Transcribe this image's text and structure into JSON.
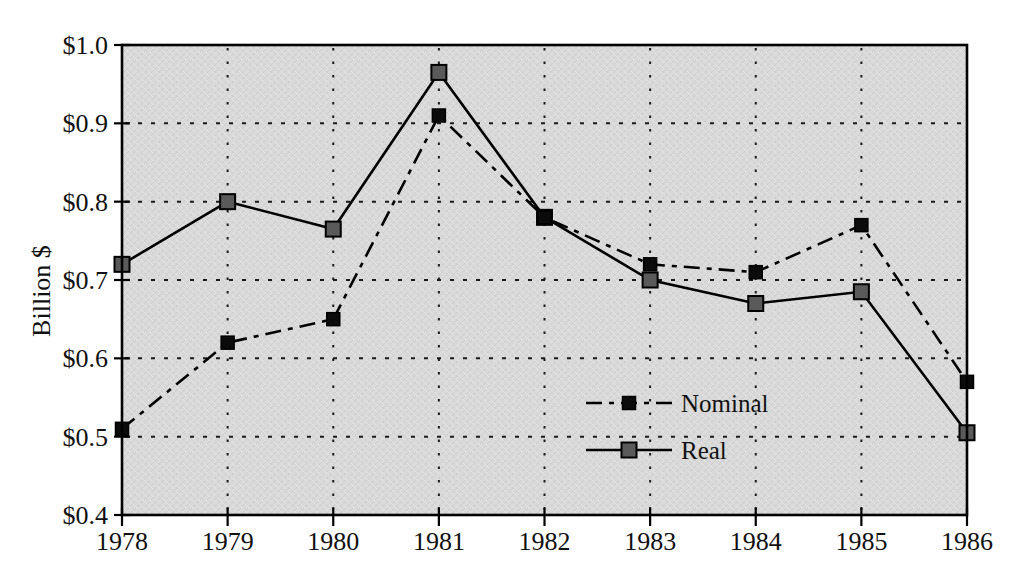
{
  "figure": {
    "background": "#ffffff",
    "text_color": "#111111"
  },
  "chart_data": {
    "type": "line",
    "title": "",
    "xlabel": "",
    "ylabel": "Billion $",
    "categories": [
      "1978",
      "1979",
      "1980",
      "1981",
      "1982",
      "1983",
      "1984",
      "1985",
      "1986"
    ],
    "series": [
      {
        "name": "Nominal",
        "values": [
          0.51,
          0.62,
          0.65,
          0.91,
          0.78,
          0.72,
          0.71,
          0.77,
          0.57
        ],
        "line_style": "dash-dot",
        "line_color": "#000000",
        "marker": "square",
        "marker_fill": "#0b0b0b",
        "marker_size": 13
      },
      {
        "name": "Real",
        "values": [
          0.72,
          0.8,
          0.765,
          0.965,
          0.78,
          0.7,
          0.67,
          0.685,
          0.505
        ],
        "line_style": "solid",
        "line_color": "#000000",
        "marker": "square",
        "marker_fill": "#5a5a5a",
        "marker_size": 15
      }
    ],
    "ylim": [
      0.4,
      1.0
    ],
    "y_ticks": [
      {
        "value": 1.0,
        "label": "$1.0"
      },
      {
        "value": 0.9,
        "label": "$0.9"
      },
      {
        "value": 0.8,
        "label": "$0.8"
      },
      {
        "value": 0.7,
        "label": "$0.7"
      },
      {
        "value": 0.6,
        "label": "$0.6"
      },
      {
        "value": 0.5,
        "label": "$0.5"
      },
      {
        "value": 0.4,
        "label": "$0.4"
      }
    ],
    "grid": "dotted",
    "plot_bg": "#d9d9d9",
    "axis_color": "#000000",
    "legend": {
      "position": "inside-lower-right",
      "items": [
        "Nominal",
        "Real"
      ]
    }
  }
}
